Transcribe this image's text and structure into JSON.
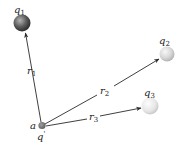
{
  "diagram": {
    "type": "vector-diagram",
    "origin": {
      "point_label": "a",
      "charge_label": "q",
      "charge_prime": "'",
      "x": 42,
      "y": 126,
      "color": "#7a7a7a"
    },
    "charges": [
      {
        "id": "q1",
        "symbol": "q",
        "subscript": "1",
        "x": 22,
        "y": 23,
        "r": 8.5,
        "fill_light": "#b0b0b0",
        "fill_dark": "#2e2e2e"
      },
      {
        "id": "q2",
        "symbol": "q",
        "subscript": "2",
        "x": 167,
        "y": 54,
        "r": 7.5,
        "fill_light": "#f4f4f4",
        "fill_dark": "#b8b8b8"
      },
      {
        "id": "q3",
        "symbol": "q",
        "subscript": "3",
        "x": 150,
        "y": 106,
        "r": 8.5,
        "fill_light": "#fafafa",
        "fill_dark": "#cfcfcf"
      }
    ],
    "vectors": [
      {
        "id": "r1",
        "symbol": "r",
        "subscript": "1",
        "from": "origin",
        "to": "q1"
      },
      {
        "id": "r2",
        "symbol": "r",
        "subscript": "2",
        "from": "origin",
        "to": "q2"
      },
      {
        "id": "r3",
        "symbol": "r",
        "subscript": "3",
        "from": "origin",
        "to": "q3"
      }
    ]
  },
  "labels": {
    "q1_sym": "q",
    "q1_sub": "1",
    "q2_sym": "q",
    "q2_sub": "2",
    "q3_sym": "q",
    "q3_sub": "3",
    "r1_sym": "r",
    "r1_sub": "1",
    "r2_sym": "r",
    "r2_sub": "2",
    "r3_sym": "r",
    "r3_sub": "3",
    "origin_point": "a",
    "origin_charge": "q"
  }
}
